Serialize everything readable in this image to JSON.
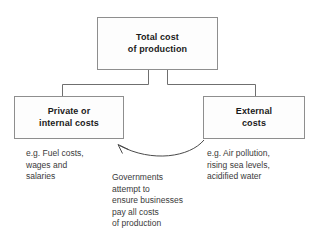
{
  "diagram": {
    "title_node": {
      "label": "Total cost\nof production",
      "name": "total-cost-node"
    },
    "branches": [
      {
        "label": "Private or\ninternal costs",
        "name": "private-internal-costs-node",
        "example": "e.g. Fuel costs,\nwages and\nsalaries"
      },
      {
        "label": "External\ncosts",
        "name": "external-costs-node",
        "example": "e.g. Air pollution,\nrising sea levels,\nacidified water"
      }
    ],
    "annotation": {
      "text": "Governments\nattempt to\nensure businesses\npay all costs\nof production",
      "name": "government-intervention-note"
    },
    "colors": {
      "box_fill": "#fdfdfd",
      "box_border": "#8e8e8e",
      "connector": "#6f6f6f",
      "arrow": "#4a4a4a",
      "title_text": "#1a1a1a",
      "body_text": "#3a3a3a",
      "background": "#ffffff"
    }
  }
}
